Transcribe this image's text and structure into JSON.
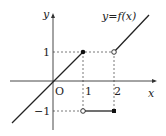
{
  "diagram": {
    "function_label": "y=f(x)",
    "axes": {
      "x_label": "x",
      "y_label": "y",
      "origin_label": "O"
    },
    "x_ticks": [
      "1",
      "2"
    ],
    "y_ticks": [
      "1",
      "−1"
    ],
    "colors": {
      "line": "#222222",
      "dash": "#555555",
      "background": "#ffffff"
    },
    "pieces": [
      {
        "domain": "x ≤ 1",
        "formula": "y = x",
        "endpoint": {
          "x": 1,
          "y": 1,
          "closed": true
        }
      },
      {
        "domain": "1 < x ≤ 2",
        "formula": "y = -1",
        "start": {
          "x": 1,
          "y": -1,
          "closed": false
        },
        "end": {
          "x": 2,
          "y": -1,
          "closed": true
        }
      },
      {
        "domain": "x > 2",
        "formula": "y = x - 1",
        "start": {
          "x": 2,
          "y": 1,
          "closed": false
        }
      }
    ]
  }
}
